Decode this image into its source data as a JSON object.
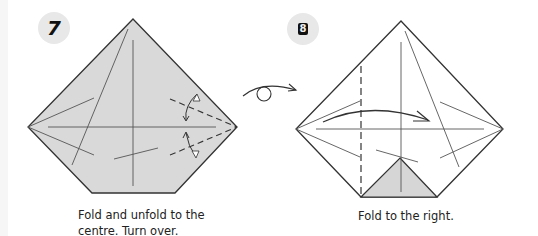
{
  "steps": [
    {
      "number": "7",
      "caption_line1": "Fold and unfold to the",
      "caption_line2": "centre. Turn over.",
      "paper_color": "#d9d9d9"
    },
    {
      "number": "8",
      "caption": "Fold to the right.",
      "paper_color": "#ffffff",
      "flap_color": "#d6d6d6"
    }
  ],
  "symbols": {
    "turn_over": "turn-over-icon"
  },
  "colors": {
    "line": "#333333",
    "badge_bg": "#e8e8e8"
  }
}
